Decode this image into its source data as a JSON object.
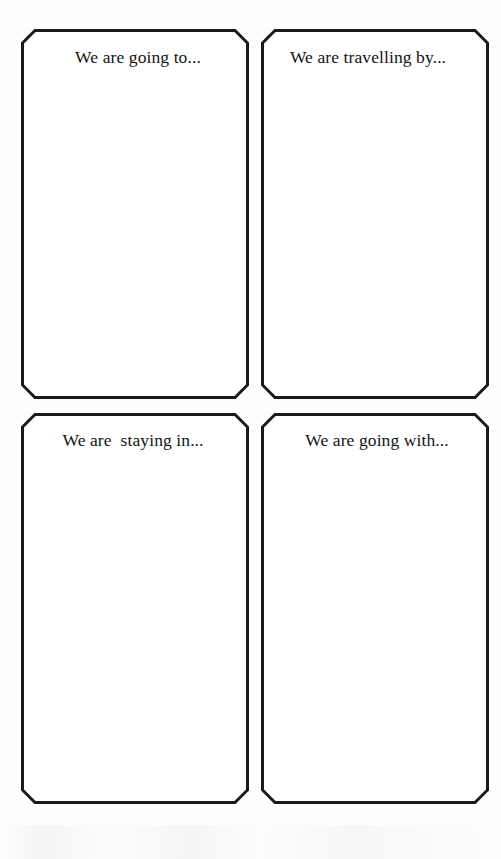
{
  "page": {
    "background_color": "#fefefe",
    "ink_color": "#1a1a1a",
    "text_color": "#141414",
    "width": 501,
    "height": 859
  },
  "worksheet": {
    "title": "Holiday planning prompt cards",
    "card_style": {
      "shape": "octagon-chamfered-rectangle",
      "border_width": 3,
      "chamfer": 14,
      "fill": "#ffffff",
      "stroke": "#1a1a1a"
    },
    "cards": [
      {
        "id": "going-to",
        "prompt": "We are going to...",
        "row": 1,
        "column": 1
      },
      {
        "id": "travelling-by",
        "prompt": "We are travelling by...",
        "row": 1,
        "column": 2
      },
      {
        "id": "staying-in",
        "prompt": "We are  staying in...",
        "row": 2,
        "column": 1
      },
      {
        "id": "going-with",
        "prompt": "We are going with...",
        "row": 2,
        "column": 2
      }
    ]
  }
}
